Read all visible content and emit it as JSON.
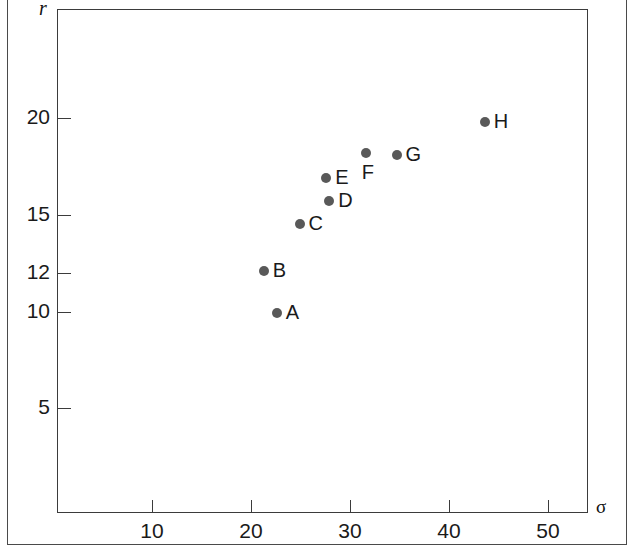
{
  "chart_data": {
    "type": "scatter",
    "title": "",
    "xlabel": "σ",
    "ylabel": "r",
    "xlim": [
      0,
      54
    ],
    "ylim": [
      0,
      26.5
    ],
    "grid": false,
    "legend": "none",
    "xticks": [
      10,
      20,
      30,
      40,
      50
    ],
    "xticklabels": [
      "10",
      "20",
      "30",
      "40",
      "50"
    ],
    "yticks": [
      5,
      10,
      12,
      15,
      20
    ],
    "yticklabels": [
      "5",
      "10",
      "12",
      "15",
      "20"
    ],
    "point_labels": [
      "A",
      "B",
      "C",
      "D",
      "E",
      "F",
      "G",
      "H"
    ],
    "points": [
      {
        "label": "A",
        "x": 22.6,
        "y": 9.9,
        "label_pos": "right"
      },
      {
        "label": "B",
        "x": 21.3,
        "y": 12.1,
        "label_pos": "right"
      },
      {
        "label": "C",
        "x": 24.9,
        "y": 14.5,
        "label_pos": "right"
      },
      {
        "label": "D",
        "x": 27.9,
        "y": 15.7,
        "label_pos": "right"
      },
      {
        "label": "E",
        "x": 27.6,
        "y": 16.9,
        "label_pos": "right"
      },
      {
        "label": "F",
        "x": 31.6,
        "y": 18.2,
        "label_pos": "below-right"
      },
      {
        "label": "G",
        "x": 34.7,
        "y": 18.1,
        "label_pos": "right"
      },
      {
        "label": "H",
        "x": 43.6,
        "y": 19.8,
        "label_pos": "right"
      }
    ],
    "marker_color": "#595959",
    "axis_color": "#3b3b3b",
    "text_color": "#1a1a1a",
    "background_color": "#ffffff"
  }
}
